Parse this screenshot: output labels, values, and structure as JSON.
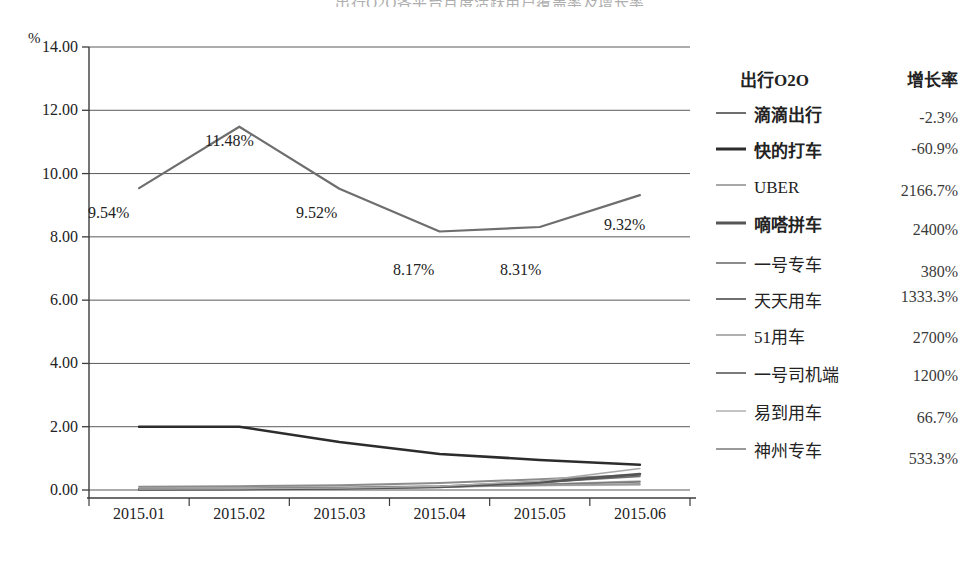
{
  "title_sliver": "出行O2O各平台月度活跃用户覆盖率及增长率",
  "axis": {
    "y_unit": "%",
    "y_ticks": [
      "14.00",
      "12.00",
      "10.00",
      "8.00",
      "6.00",
      "4.00",
      "2.00",
      "0.00"
    ],
    "x_ticks": [
      "2015.01",
      "2015.02",
      "2015.03",
      "2015.04",
      "2015.05",
      "2015.06"
    ]
  },
  "point_labels": [
    {
      "text": "9.54%",
      "x": 88,
      "y": 205
    },
    {
      "text": "11.48%",
      "x": 205,
      "y": 133
    },
    {
      "text": "9.52%",
      "x": 296,
      "y": 205
    },
    {
      "text": "8.17%",
      "x": 393,
      "y": 262
    },
    {
      "text": "8.31%",
      "x": 500,
      "y": 262
    },
    {
      "text": "9.32%",
      "x": 604,
      "y": 217
    }
  ],
  "legend": {
    "header_name": "出行O2O",
    "header_rate": "增长率",
    "rows": [
      {
        "label": "滴滴出行",
        "rate": "-2.3%",
        "color": "#6e6e6e",
        "width": 2.2,
        "bold": true,
        "name_dy": 0,
        "rate_dy": 2
      },
      {
        "label": "快的打车",
        "rate": "-60.9%",
        "color": "#2c2c2c",
        "width": 3.4,
        "bold": true,
        "name_dy": 0,
        "rate_dy": -3
      },
      {
        "label": "UBER",
        "rate": "2166.7%",
        "color": "#a8a8a8",
        "width": 2.0,
        "bold": false,
        "name_dy": 0,
        "rate_dy": 3
      },
      {
        "label": "嘀嗒拼车",
        "rate": "2400%",
        "color": "#555555",
        "width": 3.6,
        "bold": true,
        "name_dy": 0,
        "rate_dy": 4
      },
      {
        "label": "一号专车",
        "rate": "380%",
        "color": "#8c8c8c",
        "width": 2.6,
        "bold": false,
        "name_dy": 0,
        "rate_dy": 6
      },
      {
        "label": "天天用车",
        "rate": "1333.3%",
        "color": "#707070",
        "width": 2.2,
        "bold": false,
        "name_dy": 0,
        "rate_dy": -5
      },
      {
        "label": "51用车",
        "rate": "2700%",
        "color": "#b0b0b0",
        "width": 2.2,
        "bold": false,
        "name_dy": 0,
        "rate_dy": 0
      },
      {
        "label": "一号司机端",
        "rate": "1200%",
        "color": "#7a7a7a",
        "width": 2.4,
        "bold": false,
        "name_dy": 0,
        "rate_dy": 0
      },
      {
        "label": "易到用车",
        "rate": "66.7%",
        "color": "#c4c4c4",
        "width": 2.0,
        "bold": false,
        "name_dy": 0,
        "rate_dy": 4
      },
      {
        "label": "神州专车",
        "rate": "533.3%",
        "color": "#9a9a9a",
        "width": 2.4,
        "bold": false,
        "name_dy": 0,
        "rate_dy": 7
      }
    ]
  },
  "chart_data": {
    "type": "line",
    "title": "出行O2O各平台月度活跃用户覆盖率及增长率",
    "xlabel": "",
    "ylabel": "%",
    "ylim": [
      0,
      14
    ],
    "yticks": [
      0,
      2,
      4,
      6,
      8,
      10,
      12,
      14
    ],
    "grid": true,
    "legend_position": "right",
    "categories": [
      "2015.01",
      "2015.02",
      "2015.03",
      "2015.04",
      "2015.05",
      "2015.06"
    ],
    "data_labels": [
      "9.54%",
      "11.48%",
      "9.52%",
      "8.17%",
      "8.31%",
      "9.32%"
    ],
    "series": [
      {
        "name": "滴滴出行",
        "growth_rate": "-2.3%",
        "values": [
          9.54,
          11.48,
          9.52,
          8.17,
          8.31,
          9.32
        ]
      },
      {
        "name": "快的打车",
        "growth_rate": "-60.9%",
        "values": [
          2.0,
          2.0,
          1.52,
          1.14,
          0.95,
          0.8
        ]
      },
      {
        "name": "UBER",
        "growth_rate": "2166.7%",
        "values": [
          0.03,
          0.04,
          0.06,
          0.12,
          0.28,
          0.68
        ]
      },
      {
        "name": "嘀嗒拼车",
        "growth_rate": "2400%",
        "values": [
          0.02,
          0.03,
          0.05,
          0.1,
          0.24,
          0.5
        ]
      },
      {
        "name": "一号专车",
        "growth_rate": "380%",
        "values": [
          0.1,
          0.12,
          0.15,
          0.22,
          0.34,
          0.48
        ]
      },
      {
        "name": "天天用车",
        "growth_rate": "1333.3%",
        "values": [
          0.03,
          0.04,
          0.06,
          0.11,
          0.24,
          0.43
        ]
      },
      {
        "name": "51用车",
        "growth_rate": "2700%",
        "values": [
          0.01,
          0.02,
          0.04,
          0.09,
          0.18,
          0.28
        ]
      },
      {
        "name": "一号司机端",
        "growth_rate": "1200%",
        "values": [
          0.02,
          0.03,
          0.05,
          0.1,
          0.17,
          0.26
        ]
      },
      {
        "name": "易到用车",
        "growth_rate": "66.7%",
        "values": [
          0.09,
          0.1,
          0.11,
          0.13,
          0.14,
          0.15
        ]
      },
      {
        "name": "神州专车",
        "growth_rate": "533.3%",
        "values": [
          0.03,
          0.04,
          0.06,
          0.1,
          0.15,
          0.19
        ]
      }
    ]
  }
}
